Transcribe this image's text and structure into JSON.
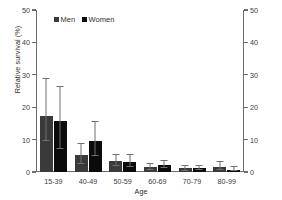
{
  "chart_data": {
    "type": "bar",
    "title": "",
    "xlabel": "Age",
    "ylabel": "Relative survival (%)",
    "categories": [
      "15-39",
      "40-49",
      "50-59",
      "60-69",
      "70-79",
      "80-99"
    ],
    "ylim": [
      0,
      50
    ],
    "yticks": [
      0,
      10,
      20,
      30,
      40,
      50
    ],
    "ytick_labels": [
      "0",
      "10",
      "20",
      "30",
      "40",
      "50"
    ],
    "right_axis": {
      "ylim": [
        0,
        50
      ],
      "yticks": [
        0,
        10,
        20,
        30,
        40,
        50
      ],
      "ytick_labels": [
        "0",
        "10",
        "20",
        "30",
        "40",
        "50"
      ]
    },
    "grid": false,
    "legend_position": "top-left",
    "error_bars": "95% confidence interval",
    "series": [
      {
        "name": "Men",
        "color": "#3a3a3a",
        "values": [
          17.3,
          5.1,
          3.5,
          1.5,
          1.1,
          1.6
        ],
        "err_low": [
          9.6,
          2.4,
          1.8,
          0.6,
          0.4,
          0.6
        ],
        "err_high": [
          28.7,
          8.5,
          5.2,
          2.4,
          1.9,
          3.0
        ]
      },
      {
        "name": "Women",
        "color": "#0b0b0b",
        "values": [
          15.6,
          9.5,
          3.1,
          2.2,
          1.1,
          0.7
        ],
        "err_low": [
          7.0,
          5.0,
          1.5,
          1.2,
          0.5,
          0.2
        ],
        "err_high": [
          26.2,
          15.3,
          5.3,
          3.3,
          1.8,
          1.5
        ]
      }
    ]
  },
  "legend": {
    "items": [
      {
        "label": "Men"
      },
      {
        "label": "Women"
      }
    ]
  }
}
